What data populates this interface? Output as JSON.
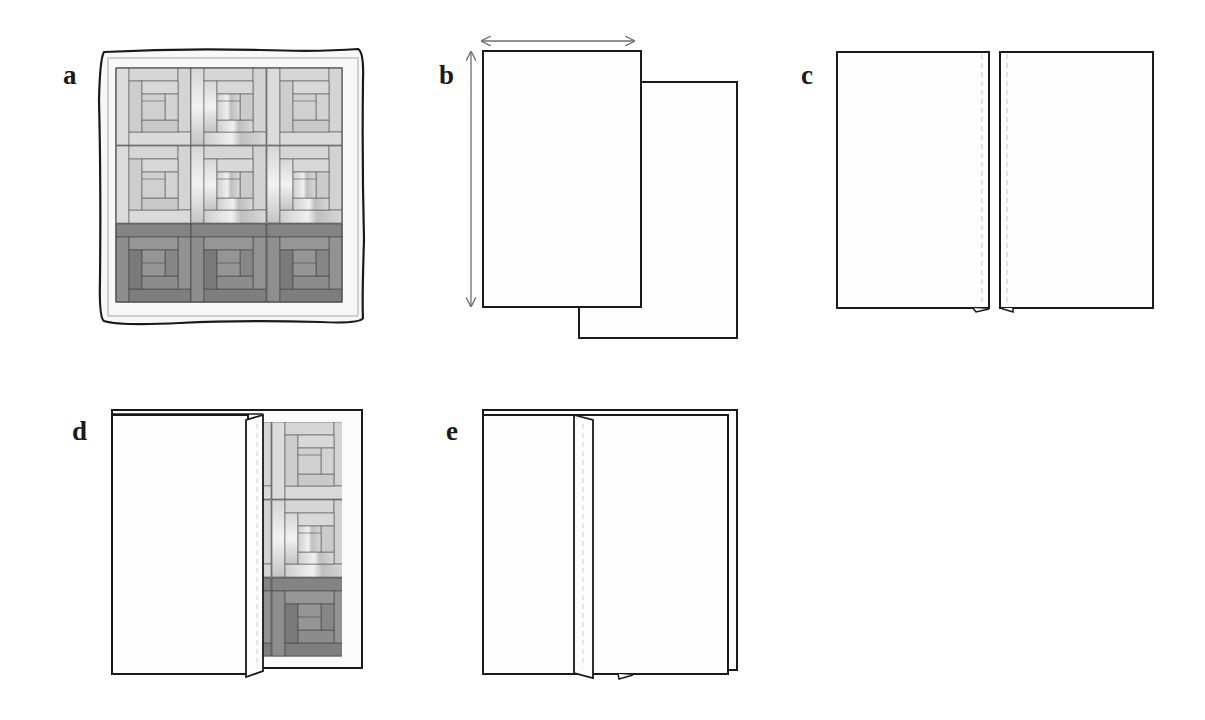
{
  "figure": {
    "panels": [
      {
        "id": "a",
        "label": "a",
        "description": "Finished log cabin quilt with wavy binding edge"
      },
      {
        "id": "b",
        "label": "b",
        "description": "Two backing fabric panels offset, with width and length measurement arrows"
      },
      {
        "id": "c",
        "label": "c",
        "description": "Two backing panels placed side by side with seam allowance dashed lines"
      },
      {
        "id": "d",
        "label": "d",
        "description": "Backing panel folded over quilt top showing quilt blocks underneath"
      },
      {
        "id": "e",
        "label": "e",
        "description": "Both backing panels joined with folded seam strip covering quilt"
      }
    ],
    "colors": {
      "outline": "#1a1a1a",
      "paper": "#fdfdfd",
      "arrow": "#6e6e6e",
      "dash": "#c8c8c8",
      "light_fabric": "#d9d9d9",
      "light_fabric_alt": "#cfcfcf",
      "mid_fabric": "#bdbdbd",
      "dark_fabric": "#8a8a8a",
      "dark_fabric_alt": "#7a7a7a",
      "dark_fabric_mid": "#969696",
      "seam": "#555555"
    },
    "quilt": {
      "rows": 3,
      "cols": 3,
      "row_tones": [
        "light",
        "light",
        "dark"
      ]
    }
  }
}
